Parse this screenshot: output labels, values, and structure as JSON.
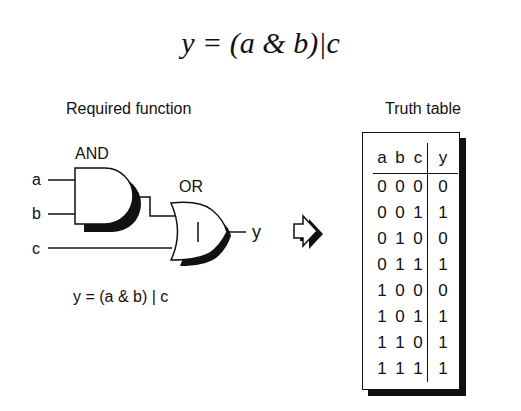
{
  "equation": "y = (a & b)|c",
  "left_panel": {
    "title": "Required function",
    "gate_and": {
      "label": "AND",
      "symbol": "&"
    },
    "gate_or": {
      "label": "OR",
      "symbol": "|"
    },
    "inputs": [
      "a",
      "b",
      "c"
    ],
    "output": "y",
    "caption": "y = (a & b) | c"
  },
  "arrow_icon": "right-arrow-icon",
  "truth_table": {
    "title": "Truth table",
    "headers": [
      "a",
      "b",
      "c",
      "y"
    ],
    "rows": [
      [
        "0",
        "0",
        "0",
        "0"
      ],
      [
        "0",
        "0",
        "1",
        "1"
      ],
      [
        "0",
        "1",
        "0",
        "0"
      ],
      [
        "0",
        "1",
        "1",
        "1"
      ],
      [
        "1",
        "0",
        "0",
        "0"
      ],
      [
        "1",
        "0",
        "1",
        "1"
      ],
      [
        "1",
        "1",
        "0",
        "1"
      ],
      [
        "1",
        "1",
        "1",
        "1"
      ]
    ]
  }
}
